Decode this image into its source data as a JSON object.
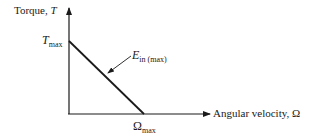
{
  "diagram": {
    "type": "line-graph",
    "y_axis": {
      "label_text": "Torque, ",
      "label_symbol": "T"
    },
    "x_axis": {
      "label_text": "Angular velocity, ",
      "label_symbol": "Ω"
    },
    "y_intercept": {
      "symbol": "T",
      "subscript": "max"
    },
    "x_intercept": {
      "symbol": "Ω",
      "subscript": "max"
    },
    "line_label": {
      "symbol": "E",
      "subscript": "in (max)"
    },
    "line_color": "#1a1a1a"
  }
}
